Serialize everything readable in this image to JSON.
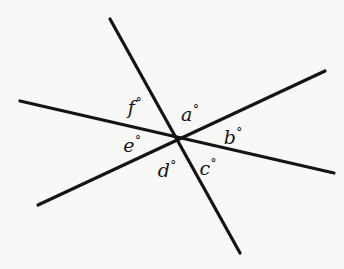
{
  "figure": {
    "background_color": "#f8f8f6",
    "line_color": "#141414",
    "line_width": 3.2,
    "intersection": {
      "x": 178,
      "y": 138
    },
    "lines": [
      {
        "name": "line-northwest-southeast",
        "x1": 20,
        "y1": 101,
        "x2": 334,
        "y2": 173
      },
      {
        "name": "line-north-south",
        "x1": 110,
        "y1": 19,
        "x2": 240,
        "y2": 253
      },
      {
        "name": "line-southwest-northeast",
        "x1": 38,
        "y1": 205,
        "x2": 325,
        "y2": 71
      }
    ]
  },
  "labels": [
    {
      "name": "angle-label-a",
      "letter": "a",
      "degree": "°",
      "x": 190,
      "y": 114
    },
    {
      "name": "angle-label-b",
      "letter": "b",
      "degree": "°",
      "x": 233,
      "y": 137
    },
    {
      "name": "angle-label-c",
      "letter": "c",
      "degree": "°",
      "x": 208,
      "y": 168
    },
    {
      "name": "angle-label-d",
      "letter": "d",
      "degree": "°",
      "x": 167,
      "y": 170
    },
    {
      "name": "angle-label-e",
      "letter": "e",
      "degree": "°",
      "x": 132,
      "y": 145
    },
    {
      "name": "angle-label-f",
      "letter": "f",
      "degree": "°",
      "x": 135,
      "y": 107
    }
  ]
}
